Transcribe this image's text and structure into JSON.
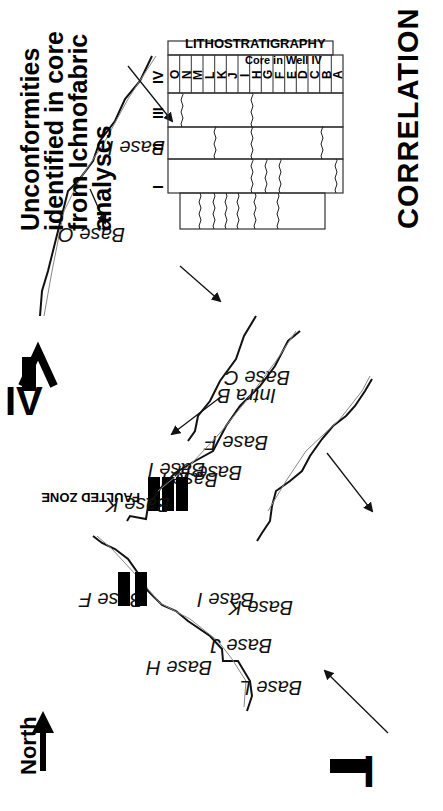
{
  "figure": {
    "orientation": "rotated -90deg (landscape figure shown in portrait)",
    "north_label": "North",
    "title_lines": [
      "Unconformities",
      "identified in core",
      "from Ichnofabric",
      "analyses"
    ],
    "correlation_label": "CORRELATION",
    "faulted_zone_label": "FAULTED ZONE",
    "panels": [
      {
        "id": "I",
        "labels": [
          "Base L",
          "Base K",
          "Base J",
          "Base I",
          "Base H",
          "Base F"
        ]
      },
      {
        "id": "II",
        "labels": [
          "Base I",
          "Base H",
          "Base F",
          "Base C"
        ]
      },
      {
        "id": "III",
        "labels": [
          "Base K",
          "Base I",
          "Intra B"
        ]
      },
      {
        "id": "IV",
        "labels": [
          "Base O",
          "Base I"
        ]
      }
    ]
  },
  "table": {
    "header_top": "LITHOSTRATIGRAPHY",
    "header_sub": "Core in Well IV",
    "units": [
      "A",
      "B",
      "C",
      "D",
      "E",
      "F",
      "G",
      "H",
      "I",
      "J",
      "K",
      "L",
      "M",
      "N",
      "O"
    ],
    "rows": [
      {
        "well": "I",
        "unconformities_at": [
          "F",
          "H",
          "I",
          "J",
          "K",
          "L"
        ]
      },
      {
        "well": "II",
        "unconformities_at": [
          "B",
          "E",
          "G",
          "H"
        ]
      },
      {
        "well": "III",
        "unconformities_at": [
          "B",
          "H",
          "K"
        ]
      },
      {
        "well": "IV",
        "unconformities_at": [
          "H",
          "N"
        ]
      }
    ]
  },
  "text": {
    "t1": "Unconformities",
    "t2": "identified in core",
    "t3": "from Ichnofabric",
    "t4": "analyses",
    "corr": "CORRELATION",
    "north": "North",
    "faulted": "FAULTED ZONE",
    "litho": "LITHOSTRATIGRAPHY",
    "core": "Core in Well IV",
    "r1": "I",
    "r2": "II",
    "r3": "III",
    "r4": "IV",
    "p1": "I",
    "p2": "II",
    "p3": "III",
    "p4": "IV",
    "baseL": "Base  L",
    "baseK1": "Base  K",
    "baseJ": "Base J",
    "baseI1": "Base  I",
    "baseH1": "Base  H",
    "baseF1": "Base  F",
    "baseI2": "Base  I",
    "baseH2": "Base  H",
    "baseF2": "Base  F",
    "baseC": "Base  C",
    "baseK3": "Base K",
    "baseI3": "Base I",
    "intraB": "Intra B",
    "baseO": "Base O",
    "baseI4": "Base I",
    "uA": "A",
    "uB": "B",
    "uC": "C",
    "uD": "D",
    "uE": "E",
    "uF": "F",
    "uG": "G",
    "uH": "H",
    "uI": "I",
    "uJ": "J",
    "uK": "K",
    "uL": "L",
    "uM": "M",
    "uN": "N",
    "uO": "O"
  }
}
